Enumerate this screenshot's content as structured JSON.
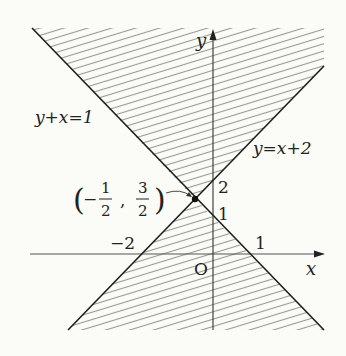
{
  "figure": {
    "type": "inequality-region-graph",
    "colors": {
      "background": "#fbfbf7",
      "line": "#1e1e1e",
      "hatch": "#9a9a95",
      "text": "#222222"
    },
    "axes": {
      "x_label": "x",
      "y_label": "y",
      "origin_label": "O"
    },
    "lines": [
      {
        "id": "line1",
        "equation": "y+x=1",
        "label": "y+x=1"
      },
      {
        "id": "line2",
        "equation": "y=x+2",
        "label": "y=x+2"
      }
    ],
    "ticks": {
      "x": [
        {
          "value": -2,
          "label": "−2"
        },
        {
          "value": 1,
          "label": "1"
        }
      ],
      "y": [
        {
          "value": 1,
          "label": "1"
        },
        {
          "value": 2,
          "label": "2"
        }
      ]
    },
    "intersection": {
      "x": -0.5,
      "y": 1.5,
      "label_open": "(",
      "label_minus": "−",
      "x_num": "1",
      "x_den": "2",
      "comma": ",",
      "y_num": "3",
      "y_den": "2",
      "label_close": ")"
    },
    "shaded_regions": [
      "above both lines (y ≥ x+2 and y ≥ −x+1) — upper wedge",
      "below both lines (y ≤ x+2 and y ≤ −x+1) — lower wedge"
    ]
  }
}
